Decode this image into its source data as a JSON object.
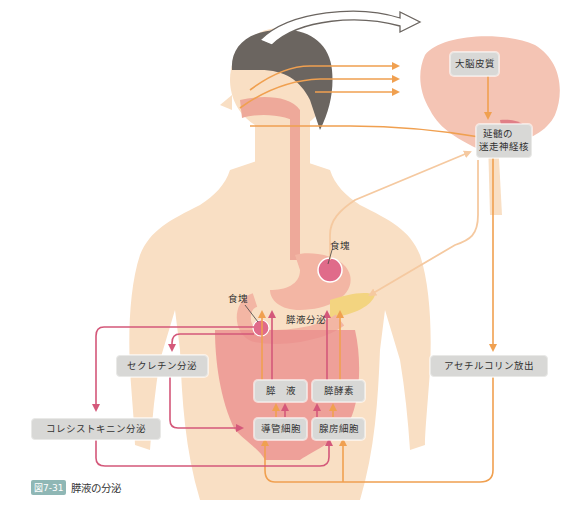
{
  "figure": {
    "number": "図7-31",
    "title": "膵液の分泌"
  },
  "labels": {
    "cerebral_cortex": "大脳皮質",
    "vagus_nucleus_line1": "延髄の",
    "vagus_nucleus_line2": "迷走神経核",
    "bolus_stomach": "食塊",
    "bolus_duodenum": "食塊",
    "pancreatic_secretion": "膵液分泌",
    "secretin": "セクレチン分泌",
    "cholecystokinin": "コレシストキニン分泌",
    "acetylcholine": "アセチルコリン放出",
    "pancreatic_juice": "膵　液",
    "pancreatic_enzymes": "膵酵素",
    "duct_cells": "導管細胞",
    "acinar_cells": "腺房細胞"
  },
  "colors": {
    "neural_orange": "#f0a050",
    "hormonal_pink": "#d4587a",
    "skin": "#f9dfc4",
    "box_gray": "#d8d8d6",
    "caption_tag": "#8fb7b5"
  }
}
